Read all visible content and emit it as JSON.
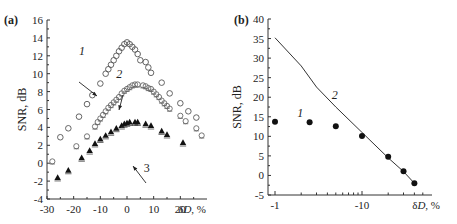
{
  "chart_data": [
    {
      "panel": "(a)",
      "type": "scatter",
      "xlabel": "δD, %",
      "ylabel": "SNR, dB",
      "xlim": [
        -30,
        30
      ],
      "ylim": [
        -4,
        16
      ],
      "xticks": [
        -30,
        -20,
        -10,
        0,
        10,
        20
      ],
      "yticks": [
        -4,
        -2,
        0,
        2,
        4,
        6,
        8,
        10,
        12,
        14,
        16
      ],
      "series": [
        {
          "name": "1",
          "marker": "open-circle",
          "x": [
            -25,
            -22,
            -18,
            -15,
            -13,
            -10,
            -8,
            -7,
            -6,
            -5,
            -4,
            -3,
            -2,
            -1,
            0,
            1,
            2,
            3,
            4,
            5,
            7,
            8,
            9,
            13,
            16,
            20,
            23,
            26
          ],
          "y": [
            2.9,
            3.9,
            5.2,
            6.6,
            7.6,
            8.9,
            10.0,
            10.5,
            11.0,
            11.5,
            12.0,
            12.5,
            12.9,
            13.3,
            13.5,
            13.3,
            13.0,
            12.7,
            12.2,
            11.5,
            11.3,
            10.7,
            10.1,
            9.0,
            7.8,
            6.7,
            5.8,
            5.1
          ]
        },
        {
          "name": "2",
          "marker": "open-square",
          "x": [
            -28,
            -19,
            -15,
            -12,
            -11,
            -10,
            -9,
            -8,
            -7,
            -6,
            -5,
            -4,
            -3,
            -2,
            -1,
            0,
            1,
            2,
            3,
            4,
            6,
            7,
            8,
            9,
            10,
            11,
            12,
            13,
            14,
            15,
            16,
            20,
            22,
            26,
            28
          ],
          "y": [
            0.2,
            1.9,
            3.0,
            4.1,
            4.6,
            5.0,
            5.4,
            5.8,
            6.2,
            6.5,
            6.8,
            7.1,
            7.4,
            7.8,
            8.1,
            8.3,
            8.5,
            8.7,
            8.8,
            8.8,
            8.7,
            8.6,
            8.4,
            8.3,
            8.0,
            7.7,
            7.4,
            7.0,
            6.7,
            6.4,
            6.1,
            5.3,
            4.7,
            3.9,
            3.1
          ]
        },
        {
          "name": "3",
          "marker": "filled-triangle",
          "x": [
            -26,
            -22,
            -17,
            -14,
            -12,
            -10,
            -8,
            -6,
            -4,
            -2,
            -1,
            0,
            1,
            3,
            4,
            7,
            9,
            13,
            15,
            21
          ],
          "y": [
            -1.6,
            -0.8,
            0.6,
            1.4,
            2.2,
            2.7,
            3.1,
            3.5,
            3.9,
            4.2,
            4.4,
            4.5,
            4.6,
            4.6,
            4.6,
            4.4,
            4.2,
            3.6,
            3.2,
            2.3
          ]
        }
      ],
      "annotations": [
        {
          "text": "1",
          "x": -18,
          "y": 12.5
        },
        {
          "text": "2",
          "x": -4,
          "y": 10.0
        },
        {
          "text": "3",
          "x": 10,
          "y": 1.0
        }
      ]
    },
    {
      "panel": "(b)",
      "type": "scatter",
      "xscale": "log (negative values)",
      "xlabel": "δD, %",
      "ylabel": "SNR, dB",
      "xlim": [
        -1,
        -50
      ],
      "ylim": [
        -5,
        40
      ],
      "xticks": [
        -1,
        -10
      ],
      "yticks": [
        -5,
        0,
        5,
        10,
        15,
        20,
        25,
        30,
        35,
        40
      ],
      "series": [
        {
          "name": "1",
          "marker": "filled-circle",
          "x": [
            -1,
            -2.5,
            -5,
            -10,
            -20,
            -30,
            -40
          ],
          "y": [
            13.7,
            13.6,
            12.6,
            10.1,
            4.8,
            1.1,
            -2.0
          ]
        },
        {
          "name": "2",
          "marker": "line",
          "x": [
            -1,
            -2,
            -3,
            -5,
            -10,
            -20,
            -30,
            -40
          ],
          "y": [
            35.2,
            28.0,
            22.6,
            17.5,
            11.0,
            4.5,
            1.0,
            -2.0
          ]
        }
      ],
      "annotations": [
        {
          "text": "1",
          "x": -1.8,
          "y": 16
        },
        {
          "text": "2",
          "x": -4.5,
          "y": 20.5
        }
      ]
    }
  ],
  "labels": {
    "panel_a": "(a)",
    "panel_b": "(b)",
    "ylabel": "SNR, dB",
    "xlabel_sym": "δ",
    "xlabel_var": "D",
    "xlabel_unit": ", %"
  }
}
